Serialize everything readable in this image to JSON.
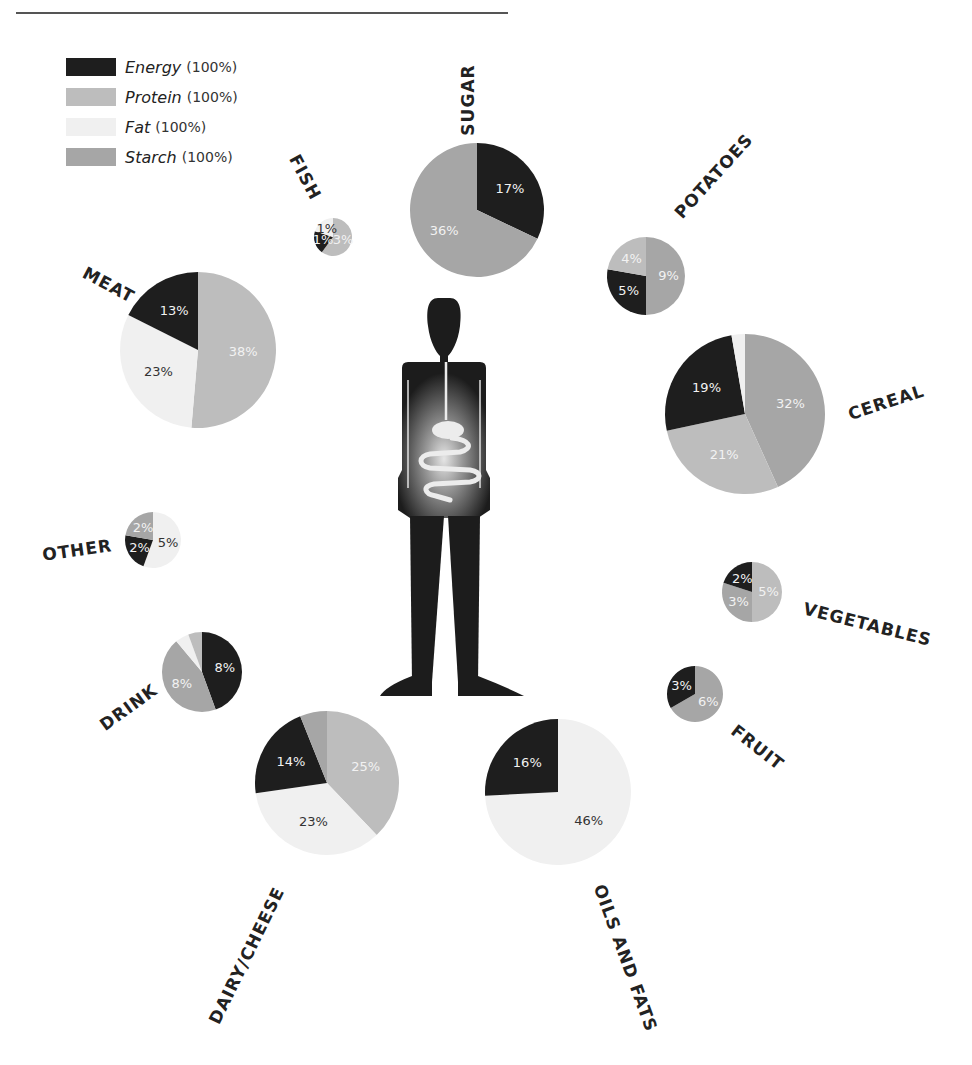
{
  "legend": [
    {
      "name": "Energy",
      "pct": "(100%)",
      "key": "energy"
    },
    {
      "name": "Protein",
      "pct": "(100%)",
      "key": "protein"
    },
    {
      "name": "Fat",
      "pct": "(100%)",
      "key": "fat"
    },
    {
      "name": "Starch",
      "pct": "(100%)",
      "key": "starch"
    }
  ],
  "colors": {
    "energy": "#1e1e1e",
    "protein": "#bdbdbd",
    "fat": "#f0f0f0",
    "starch": "#a6a6a6",
    "figure": "#1c1c1c"
  },
  "chart_data": {
    "type": "pie",
    "title": "",
    "series_keys": [
      "energy",
      "protein",
      "fat",
      "starch"
    ],
    "legend_placement": "top-left",
    "pies": [
      {
        "category": "SUGAR",
        "slices": [
          {
            "key": "energy",
            "value": 17,
            "label": "17%"
          },
          {
            "key": "starch",
            "value": 36,
            "label": "36%"
          }
        ]
      },
      {
        "category": "POTATOES",
        "slices": [
          {
            "key": "starch",
            "value": 9,
            "label": "9%"
          },
          {
            "key": "energy",
            "value": 5,
            "label": "5%"
          },
          {
            "key": "protein",
            "value": 4,
            "label": "4%"
          }
        ]
      },
      {
        "category": "CEREAL",
        "slices": [
          {
            "key": "starch",
            "value": 32,
            "label": "32%"
          },
          {
            "key": "protein",
            "value": 21,
            "label": "21%"
          },
          {
            "key": "energy",
            "value": 19,
            "label": "19%"
          },
          {
            "key": "fat",
            "value": 2,
            "label": ""
          }
        ]
      },
      {
        "category": "VEGETABLES",
        "slices": [
          {
            "key": "protein",
            "value": 5,
            "label": "5%"
          },
          {
            "key": "starch",
            "value": 3,
            "label": "3%"
          },
          {
            "key": "energy",
            "value": 2,
            "label": "2%"
          }
        ]
      },
      {
        "category": "FRUIT",
        "slices": [
          {
            "key": "starch",
            "value": 6,
            "label": "6%"
          },
          {
            "key": "energy",
            "value": 3,
            "label": "3%"
          }
        ]
      },
      {
        "category": "OILS AND FATS",
        "slices": [
          {
            "key": "fat",
            "value": 46,
            "label": "46%"
          },
          {
            "key": "energy",
            "value": 16,
            "label": "16%"
          }
        ]
      },
      {
        "category": "DAIRY/CHEESE",
        "slices": [
          {
            "key": "protein",
            "value": 25,
            "label": "25%"
          },
          {
            "key": "fat",
            "value": 23,
            "label": "23%"
          },
          {
            "key": "energy",
            "value": 14,
            "label": "14%"
          },
          {
            "key": "starch",
            "value": 4,
            "label": ""
          }
        ]
      },
      {
        "category": "DRINK",
        "slices": [
          {
            "key": "energy",
            "value": 8,
            "label": "8%"
          },
          {
            "key": "starch",
            "value": 8,
            "label": "8%"
          },
          {
            "key": "fat",
            "value": 1,
            "label": ""
          },
          {
            "key": "protein",
            "value": 1,
            "label": ""
          }
        ]
      },
      {
        "category": "OTHER",
        "slices": [
          {
            "key": "fat",
            "value": 5,
            "label": "5%"
          },
          {
            "key": "energy",
            "value": 2,
            "label": "2%"
          },
          {
            "key": "starch",
            "value": 2,
            "label": "2%"
          }
        ]
      },
      {
        "category": "MEAT",
        "slices": [
          {
            "key": "protein",
            "value": 38,
            "label": "38%"
          },
          {
            "key": "fat",
            "value": 23,
            "label": "23%"
          },
          {
            "key": "energy",
            "value": 13,
            "label": "13%"
          }
        ]
      },
      {
        "category": "FISH",
        "slices": [
          {
            "key": "protein",
            "value": 3,
            "label": "3%"
          },
          {
            "key": "energy",
            "value": 1,
            "label": "1%"
          },
          {
            "key": "fat",
            "value": 1,
            "label": "1%"
          }
        ]
      }
    ]
  }
}
